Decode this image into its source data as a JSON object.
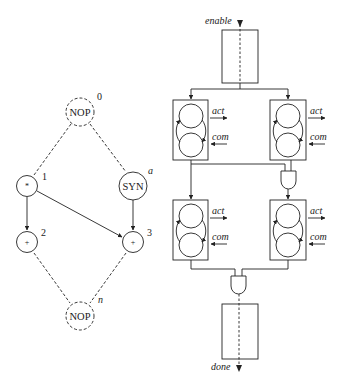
{
  "colors": {
    "stroke": "#222222",
    "background": "#ffffff"
  },
  "dfg": {
    "nodes": [
      {
        "id": "n0",
        "op": "NOP",
        "label": "0",
        "dashed": true
      },
      {
        "id": "n1",
        "op": "*",
        "label": "1",
        "dashed": false
      },
      {
        "id": "na",
        "op": "SYN",
        "label": "a",
        "dashed": false
      },
      {
        "id": "n2",
        "op": "+",
        "label": "2",
        "dashed": false
      },
      {
        "id": "n3",
        "op": "+",
        "label": "3",
        "dashed": false
      },
      {
        "id": "nn",
        "op": "NOP",
        "label": "n",
        "dashed": true
      }
    ],
    "edges": [
      {
        "from": "n0",
        "to": "n1",
        "style": "dashed"
      },
      {
        "from": "n0",
        "to": "na",
        "style": "dashed"
      },
      {
        "from": "n1",
        "to": "n2",
        "style": "solid-arrow"
      },
      {
        "from": "n1",
        "to": "n3",
        "style": "solid-arrow"
      },
      {
        "from": "na",
        "to": "n3",
        "style": "solid-arrow"
      },
      {
        "from": "n2",
        "to": "nn",
        "style": "dashed"
      },
      {
        "from": "n3",
        "to": "nn",
        "style": "dashed"
      }
    ]
  },
  "controller": {
    "enable_label": "enable",
    "done_label": "done",
    "units": [
      {
        "id": "u1",
        "act_label": "act",
        "com_label": "com"
      },
      {
        "id": "u2",
        "act_label": "act",
        "com_label": "com"
      },
      {
        "id": "u3",
        "act_label": "act",
        "com_label": "com"
      },
      {
        "id": "u4",
        "act_label": "act",
        "com_label": "com"
      }
    ]
  }
}
